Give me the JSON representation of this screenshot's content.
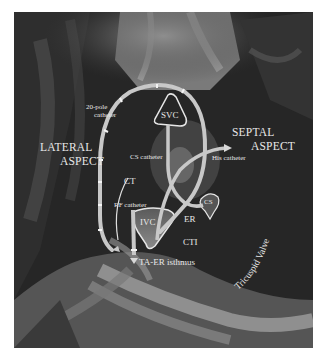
{
  "figure": {
    "labels": {
      "lateral_aspect_line1": "LATERAL",
      "lateral_aspect_line2": "ASPECT",
      "septal_aspect_line1": "SEPTAL",
      "septal_aspect_line2": "ASPECT",
      "twenty_pole_line1": "20-pole",
      "twenty_pole_line2": "catheter",
      "svc": "SVC",
      "cs_catheter": "CS catheter",
      "his_catheter": "His catheter",
      "ct_upper": "CT",
      "ct_lower": "CT",
      "rf_catheter": "RF catheter",
      "ivc": "IVC",
      "er": "ER",
      "cs": "CS",
      "cti": "CTI",
      "ta_er_isthmus": "TA-ER isthmus",
      "tricuspid_valve": "Tricuspid Valve"
    },
    "colors": {
      "catheter": "#c8c8c8",
      "outline": "#e6e6e6",
      "tissue_dark": "#1e1e1e",
      "tissue_light": "#8a8a8a"
    }
  }
}
